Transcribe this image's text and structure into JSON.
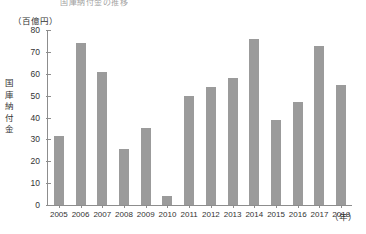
{
  "figure": {
    "title_clipped": "国庫納付金の推移",
    "y_unit": "（百億円）",
    "x_unit": "（年）",
    "y_axis_title_chars": [
      "国",
      "庫",
      "納",
      "付",
      "金"
    ],
    "bar_color": "#9b9b9b",
    "axis_color": "#8d8d8d"
  },
  "chart_data": {
    "type": "bar",
    "title": "国庫納付金の推移",
    "xlabel": "（年）",
    "ylabel": "国庫納付金",
    "yunit": "（百億円）",
    "ylim": [
      0,
      80
    ],
    "yticks": [
      0,
      10,
      20,
      30,
      40,
      50,
      60,
      70,
      80
    ],
    "ytick_labels": [
      "0",
      "10",
      "20",
      "30",
      "40",
      "50",
      "60",
      "70",
      "80"
    ],
    "grid": false,
    "legend": "none",
    "categories": [
      "2005",
      "2006",
      "2007",
      "2008",
      "2009",
      "2010",
      "2011",
      "2012",
      "2013",
      "2014",
      "2015",
      "2016",
      "2017",
      "2018"
    ],
    "values": [
      31.5,
      74,
      61,
      25.5,
      35,
      4,
      50,
      54,
      58,
      76,
      39,
      47,
      72.5,
      55
    ]
  }
}
